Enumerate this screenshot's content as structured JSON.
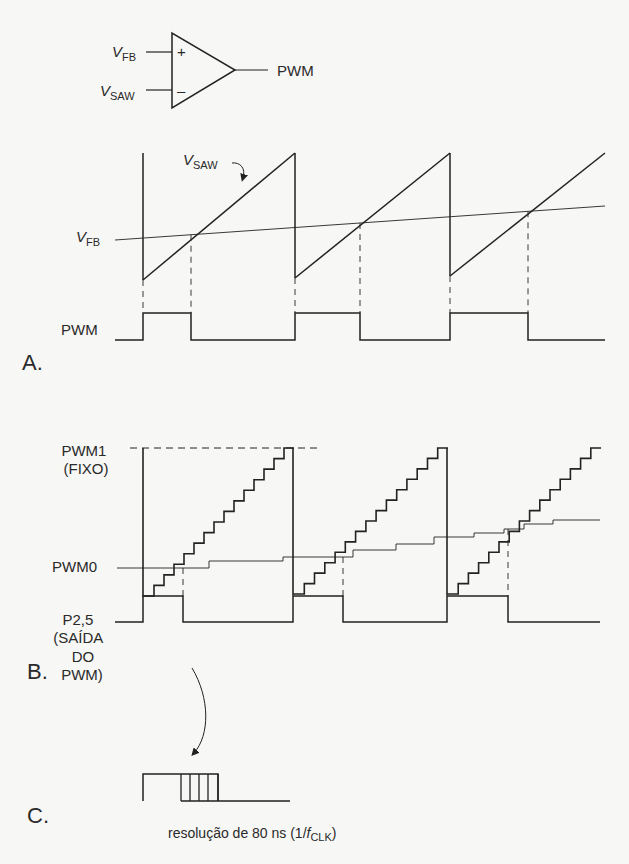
{
  "colors": {
    "ink": "#222222",
    "background": "#f7f7f5"
  },
  "comparator": {
    "input_plus": {
      "symbol": "V",
      "subscript": "FB",
      "sign": "+"
    },
    "input_minus": {
      "symbol": "V",
      "subscript": "SAW",
      "sign": "–"
    },
    "output_label": "PWM"
  },
  "section_a": {
    "label": "A.",
    "vsaw_label": {
      "symbol": "V",
      "subscript": "SAW"
    },
    "vfb_label": {
      "symbol": "V",
      "subscript": "FB"
    },
    "pwm_label": "PWM",
    "periods": [
      {
        "start": 143,
        "end": 295,
        "bottom": 280,
        "cross_x": 191
      },
      {
        "start": 295,
        "end": 450,
        "bottom": 278,
        "cross_x": 360
      },
      {
        "start": 450,
        "end": 605,
        "bottom": 276,
        "cross_x": 528
      }
    ],
    "saw_top": 153,
    "vfb_line": {
      "x1": 115,
      "y1": 240,
      "x2": 605,
      "y2": 206
    },
    "pwm_levels": {
      "low": 340,
      "high": 313
    }
  },
  "section_b": {
    "label": "B.",
    "pwm1_label": [
      "PWM1",
      "(FIXO)"
    ],
    "pwm0_label": "PWM0",
    "output_label": [
      "P2,5",
      "(SAÍDA",
      "DO",
      "PWM)"
    ],
    "pwm1_level": 448,
    "steps_per_period": 15,
    "periods": [
      {
        "start": 143,
        "end": 293,
        "bottom": 596,
        "cross_x": 183
      },
      {
        "start": 293,
        "end": 447,
        "bottom": 594,
        "cross_x": 343
      },
      {
        "start": 447,
        "end": 600,
        "bottom": 594,
        "cross_x": 508
      }
    ],
    "pwm0_steps": [
      [
        117,
        568
      ],
      [
        209,
        568
      ],
      [
        209,
        561
      ],
      [
        283,
        561
      ],
      [
        283,
        557
      ],
      [
        353,
        557
      ],
      [
        353,
        550
      ],
      [
        396,
        550
      ],
      [
        396,
        544
      ],
      [
        434,
        544
      ],
      [
        434,
        537
      ],
      [
        474,
        537
      ],
      [
        474,
        533
      ],
      [
        504,
        533
      ],
      [
        504,
        529
      ],
      [
        524,
        529
      ],
      [
        524,
        524
      ],
      [
        553,
        524
      ],
      [
        553,
        520
      ],
      [
        600,
        520
      ]
    ],
    "output_levels": {
      "low": 622,
      "high": 596
    }
  },
  "section_c": {
    "label": "C.",
    "caption": "resolução de 80 ns (1/",
    "caption_f": "f",
    "caption_sub": "CLK",
    "caption_end": ")",
    "pulse": {
      "x_start": 143,
      "x_rise": 143,
      "x_fall_first": 181,
      "x_fall_last": 218,
      "x_end": 290,
      "high": 774,
      "low": 801
    },
    "hatch_lines": [
      181,
      190,
      199,
      208,
      218
    ]
  }
}
